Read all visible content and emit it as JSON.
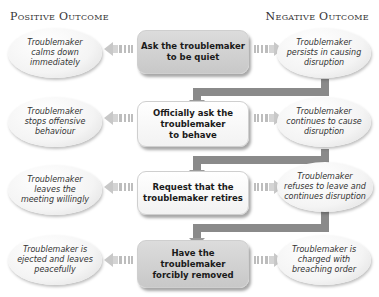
{
  "headings": {
    "positive": "Positive Outcome",
    "negative": "Negative Outcome"
  },
  "steps": [
    {
      "action": "Ask the troublemaker\nto be quiet",
      "positive": "Troublemaker\ncalms down\nimmediately",
      "negative": "Troublemaker\npersists in causing\ndisruption",
      "style": "grey"
    },
    {
      "action": "Officially ask the\ntroublemaker\nto behave",
      "positive": "Troublemaker\nstops offensive\nbehaviour",
      "negative": "Troublemaker\ncontinues to cause\ndisruption",
      "style": "white"
    },
    {
      "action": "Request that the\ntroublemaker retires",
      "positive": "Troublemaker\nleaves the\nmeeting willingly",
      "negative": "Troublemaker\nrefuses to leave and\ncontinues disruption",
      "style": "white"
    },
    {
      "action": "Have the\ntroublemaker\nforcibly removed",
      "positive": "Troublemaker is\nejected and leaves\npeacefully",
      "negative": "Troublemaker is\ncharged with\nbreaching order",
      "style": "grey"
    }
  ],
  "colors": {
    "connector": "#8a8a8a",
    "arrow": "#c8c8c8",
    "box_grey": "#d0d0d0",
    "box_white": "#f8f8f8"
  }
}
